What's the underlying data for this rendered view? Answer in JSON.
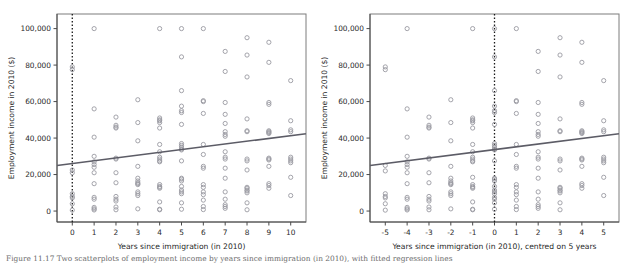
{
  "figure": {
    "caption": "Figure 11.17   Two scatterplots of employment income by years since immigration (in 2010), with fitted regression lines"
  },
  "chart_data": [
    {
      "id": "left",
      "type": "scatter",
      "title": "",
      "xlabel": "Years since immigration (in 2010)",
      "ylabel": "Employment income in 2010 ($)",
      "xlim": [
        -0.7,
        10.7
      ],
      "ylim": [
        -6000,
        108000
      ],
      "xticks": [
        0,
        1,
        2,
        3,
        4,
        5,
        6,
        7,
        8,
        9,
        10
      ],
      "xticklabels": [
        "0",
        "1",
        "2",
        "3",
        "4",
        "5",
        "6",
        "7",
        "8",
        "9",
        "10"
      ],
      "yticks": [
        0,
        20000,
        40000,
        60000,
        80000,
        100000
      ],
      "yticklabels": [
        "0",
        "20,000",
        "40,000",
        "60,000",
        "80,000",
        "100,000"
      ],
      "grid": false,
      "legend": null,
      "marker": "open-circle",
      "marker_color": "#9a9aa2",
      "fit_line": {
        "color": "#5c5c66",
        "x0": -0.7,
        "y0": 25000,
        "x1": 10.7,
        "y1": 42400,
        "intercept": 26100,
        "slope": 1530
      },
      "reference_line": {
        "type": "vertical-dashed",
        "x": 0,
        "color": "#1a1a1a"
      },
      "points": [
        [
          0,
          79000
        ],
        [
          0,
          77500
        ],
        [
          0,
          22500
        ],
        [
          0,
          21000
        ],
        [
          0,
          9500
        ],
        [
          0,
          8000
        ],
        [
          0,
          7200
        ],
        [
          0,
          4000
        ],
        [
          0,
          500
        ],
        [
          1,
          100000
        ],
        [
          1,
          56000
        ],
        [
          1,
          40500
        ],
        [
          1,
          30000
        ],
        [
          1,
          27000
        ],
        [
          1,
          25500
        ],
        [
          1,
          24000
        ],
        [
          1,
          21000
        ],
        [
          1,
          15000
        ],
        [
          1,
          7500
        ],
        [
          1,
          6500
        ],
        [
          1,
          2000
        ],
        [
          1,
          1200
        ],
        [
          1,
          600
        ],
        [
          2,
          51500
        ],
        [
          2,
          47000
        ],
        [
          2,
          46000
        ],
        [
          2,
          45500
        ],
        [
          2,
          29000
        ],
        [
          2,
          28500
        ],
        [
          2,
          21000
        ],
        [
          2,
          15500
        ],
        [
          2,
          8000
        ],
        [
          2,
          6500
        ],
        [
          2,
          5500
        ],
        [
          2,
          2200
        ],
        [
          2,
          700
        ],
        [
          3,
          61000
        ],
        [
          3,
          48500
        ],
        [
          3,
          38500
        ],
        [
          3,
          24500
        ],
        [
          3,
          18000
        ],
        [
          3,
          16500
        ],
        [
          3,
          15500
        ],
        [
          3,
          15000
        ],
        [
          3,
          14500
        ],
        [
          3,
          10500
        ],
        [
          3,
          9500
        ],
        [
          3,
          8500
        ],
        [
          3,
          1200
        ],
        [
          4,
          100000
        ],
        [
          4,
          51000
        ],
        [
          4,
          50000
        ],
        [
          4,
          49500
        ],
        [
          4,
          48500
        ],
        [
          4,
          45500
        ],
        [
          4,
          36500
        ],
        [
          4,
          32500
        ],
        [
          4,
          29500
        ],
        [
          4,
          28500
        ],
        [
          4,
          27500
        ],
        [
          4,
          27000
        ],
        [
          4,
          14500
        ],
        [
          4,
          13500
        ],
        [
          4,
          13000
        ],
        [
          4,
          12500
        ],
        [
          4,
          5000
        ],
        [
          4,
          1000
        ],
        [
          4,
          700
        ],
        [
          5,
          100000
        ],
        [
          5,
          84500
        ],
        [
          5,
          66000
        ],
        [
          5,
          57500
        ],
        [
          5,
          55000
        ],
        [
          5,
          54000
        ],
        [
          5,
          47500
        ],
        [
          5,
          37000
        ],
        [
          5,
          36000
        ],
        [
          5,
          35000
        ],
        [
          5,
          34000
        ],
        [
          5,
          33500
        ],
        [
          5,
          27500
        ],
        [
          5,
          18000
        ],
        [
          5,
          17500
        ],
        [
          5,
          16500
        ],
        [
          5,
          13500
        ],
        [
          5,
          11500
        ],
        [
          5,
          10500
        ],
        [
          5,
          9500
        ],
        [
          5,
          4500
        ],
        [
          5,
          1000
        ],
        [
          6,
          100000
        ],
        [
          6,
          60500
        ],
        [
          6,
          60000
        ],
        [
          6,
          53500
        ],
        [
          6,
          36500
        ],
        [
          6,
          31000
        ],
        [
          6,
          24500
        ],
        [
          6,
          23500
        ],
        [
          6,
          14500
        ],
        [
          6,
          13000
        ],
        [
          6,
          10500
        ],
        [
          6,
          9000
        ],
        [
          6,
          6000
        ],
        [
          6,
          2500
        ],
        [
          6,
          800
        ],
        [
          7,
          87500
        ],
        [
          7,
          76500
        ],
        [
          7,
          59500
        ],
        [
          7,
          53000
        ],
        [
          7,
          48000
        ],
        [
          7,
          43500
        ],
        [
          7,
          42000
        ],
        [
          7,
          41000
        ],
        [
          7,
          32500
        ],
        [
          7,
          29500
        ],
        [
          7,
          28500
        ],
        [
          7,
          23500
        ],
        [
          7,
          18000
        ],
        [
          7,
          10500
        ],
        [
          7,
          6500
        ],
        [
          7,
          3500
        ],
        [
          7,
          2500
        ],
        [
          7,
          1500
        ],
        [
          8,
          95000
        ],
        [
          8,
          85500
        ],
        [
          8,
          73500
        ],
        [
          8,
          50500
        ],
        [
          8,
          44000
        ],
        [
          8,
          43500
        ],
        [
          8,
          28500
        ],
        [
          8,
          27500
        ],
        [
          8,
          22500
        ],
        [
          8,
          13000
        ],
        [
          8,
          12500
        ],
        [
          8,
          11500
        ],
        [
          8,
          11000
        ],
        [
          8,
          10000
        ],
        [
          8,
          4500
        ],
        [
          8,
          700
        ],
        [
          9,
          92500
        ],
        [
          9,
          81500
        ],
        [
          9,
          59500
        ],
        [
          9,
          58500
        ],
        [
          9,
          44000
        ],
        [
          9,
          43500
        ],
        [
          9,
          43000
        ],
        [
          9,
          42500
        ],
        [
          9,
          29000
        ],
        [
          9,
          28500
        ],
        [
          9,
          28000
        ],
        [
          9,
          24500
        ],
        [
          9,
          15000
        ],
        [
          9,
          14000
        ],
        [
          9,
          12500
        ],
        [
          10,
          71500
        ],
        [
          10,
          49500
        ],
        [
          10,
          44500
        ],
        [
          10,
          43500
        ],
        [
          10,
          29500
        ],
        [
          10,
          28500
        ],
        [
          10,
          27500
        ],
        [
          10,
          26500
        ],
        [
          10,
          18500
        ],
        [
          10,
          8500
        ]
      ]
    },
    {
      "id": "right",
      "type": "scatter",
      "title": "",
      "xlabel": "Years since immigration (in 2010), centred on 5 years",
      "ylabel": "Employment income in 2010 ($)",
      "xlim": [
        -5.7,
        5.7
      ],
      "ylim": [
        -6000,
        108000
      ],
      "xticks": [
        -5,
        -4,
        -3,
        -2,
        -1,
        0,
        1,
        2,
        3,
        4,
        5
      ],
      "xticklabels": [
        "-5",
        "-4",
        "-3",
        "-2",
        "-1",
        "0",
        "1",
        "2",
        "3",
        "4",
        "5"
      ],
      "yticks": [
        0,
        20000,
        40000,
        60000,
        80000,
        100000
      ],
      "yticklabels": [
        "0",
        "20,000",
        "40,000",
        "60,000",
        "80,000",
        "100,000"
      ],
      "grid": false,
      "legend": null,
      "marker": "open-circle",
      "marker_color": "#9a9aa2",
      "fit_line": {
        "color": "#5c5c66",
        "x0": -5.7,
        "y0": 25000,
        "x1": 5.7,
        "y1": 42400,
        "intercept": 33700,
        "slope": 1530
      },
      "reference_line": {
        "type": "vertical-dashed",
        "x": 0,
        "color": "#1a1a1a"
      },
      "points": [
        [
          -5,
          79000
        ],
        [
          -5,
          77500
        ],
        [
          -5,
          25000
        ],
        [
          -5,
          22000
        ],
        [
          -5,
          9500
        ],
        [
          -5,
          8000
        ],
        [
          -5,
          7200
        ],
        [
          -5,
          4000
        ],
        [
          -5,
          500
        ],
        [
          -4,
          100000
        ],
        [
          -4,
          56000
        ],
        [
          -4,
          40500
        ],
        [
          -4,
          30000
        ],
        [
          -4,
          27000
        ],
        [
          -4,
          25500
        ],
        [
          -4,
          24000
        ],
        [
          -4,
          21000
        ],
        [
          -4,
          15000
        ],
        [
          -4,
          7500
        ],
        [
          -4,
          6500
        ],
        [
          -4,
          2000
        ],
        [
          -4,
          1200
        ],
        [
          -4,
          600
        ],
        [
          -3,
          51500
        ],
        [
          -3,
          47000
        ],
        [
          -3,
          46000
        ],
        [
          -3,
          45500
        ],
        [
          -3,
          29000
        ],
        [
          -3,
          28500
        ],
        [
          -3,
          21000
        ],
        [
          -3,
          15500
        ],
        [
          -3,
          8000
        ],
        [
          -3,
          6500
        ],
        [
          -3,
          5500
        ],
        [
          -3,
          2200
        ],
        [
          -3,
          700
        ],
        [
          -2,
          61000
        ],
        [
          -2,
          48500
        ],
        [
          -2,
          38500
        ],
        [
          -2,
          24500
        ],
        [
          -2,
          18000
        ],
        [
          -2,
          16500
        ],
        [
          -2,
          15500
        ],
        [
          -2,
          15000
        ],
        [
          -2,
          14500
        ],
        [
          -2,
          10500
        ],
        [
          -2,
          9500
        ],
        [
          -2,
          8500
        ],
        [
          -2,
          1200
        ],
        [
          -1,
          100000
        ],
        [
          -1,
          51000
        ],
        [
          -1,
          50000
        ],
        [
          -1,
          49500
        ],
        [
          -1,
          48500
        ],
        [
          -1,
          45500
        ],
        [
          -1,
          36500
        ],
        [
          -1,
          32500
        ],
        [
          -1,
          29500
        ],
        [
          -1,
          28500
        ],
        [
          -1,
          27500
        ],
        [
          -1,
          27000
        ],
        [
          -1,
          18500
        ],
        [
          -1,
          14500
        ],
        [
          -1,
          13500
        ],
        [
          -1,
          13000
        ],
        [
          -1,
          12500
        ],
        [
          -1,
          5000
        ],
        [
          -1,
          1000
        ],
        [
          -1,
          700
        ],
        [
          0,
          100000
        ],
        [
          0,
          84500
        ],
        [
          0,
          66000
        ],
        [
          0,
          57500
        ],
        [
          0,
          55000
        ],
        [
          0,
          54000
        ],
        [
          0,
          47500
        ],
        [
          0,
          37000
        ],
        [
          0,
          36000
        ],
        [
          0,
          35000
        ],
        [
          0,
          34000
        ],
        [
          0,
          33500
        ],
        [
          0,
          27500
        ],
        [
          0,
          18000
        ],
        [
          0,
          17500
        ],
        [
          0,
          16500
        ],
        [
          0,
          13500
        ],
        [
          0,
          11500
        ],
        [
          0,
          10500
        ],
        [
          0,
          9500
        ],
        [
          0,
          7500
        ],
        [
          0,
          6500
        ],
        [
          0,
          4500
        ],
        [
          0,
          1000
        ],
        [
          1,
          100000
        ],
        [
          1,
          60500
        ],
        [
          1,
          60000
        ],
        [
          1,
          53500
        ],
        [
          1,
          36500
        ],
        [
          1,
          31000
        ],
        [
          1,
          24500
        ],
        [
          1,
          23500
        ],
        [
          1,
          14500
        ],
        [
          1,
          13000
        ],
        [
          1,
          10500
        ],
        [
          1,
          9000
        ],
        [
          1,
          6000
        ],
        [
          1,
          2500
        ],
        [
          1,
          800
        ],
        [
          2,
          87500
        ],
        [
          2,
          76500
        ],
        [
          2,
          59500
        ],
        [
          2,
          53000
        ],
        [
          2,
          48000
        ],
        [
          2,
          43500
        ],
        [
          2,
          42000
        ],
        [
          2,
          41000
        ],
        [
          2,
          32500
        ],
        [
          2,
          29500
        ],
        [
          2,
          28500
        ],
        [
          2,
          23500
        ],
        [
          2,
          18000
        ],
        [
          2,
          10500
        ],
        [
          2,
          6500
        ],
        [
          2,
          3500
        ],
        [
          2,
          2500
        ],
        [
          2,
          1500
        ],
        [
          3,
          95000
        ],
        [
          3,
          85500
        ],
        [
          3,
          73500
        ],
        [
          3,
          50500
        ],
        [
          3,
          44000
        ],
        [
          3,
          43500
        ],
        [
          3,
          28500
        ],
        [
          3,
          27500
        ],
        [
          3,
          22500
        ],
        [
          3,
          13000
        ],
        [
          3,
          12500
        ],
        [
          3,
          11500
        ],
        [
          3,
          11000
        ],
        [
          3,
          10000
        ],
        [
          3,
          4500
        ],
        [
          3,
          700
        ],
        [
          4,
          92500
        ],
        [
          4,
          81500
        ],
        [
          4,
          59500
        ],
        [
          4,
          58500
        ],
        [
          4,
          44000
        ],
        [
          4,
          43500
        ],
        [
          4,
          43000
        ],
        [
          4,
          42500
        ],
        [
          4,
          29000
        ],
        [
          4,
          28500
        ],
        [
          4,
          28000
        ],
        [
          4,
          24500
        ],
        [
          4,
          15000
        ],
        [
          4,
          14000
        ],
        [
          4,
          12500
        ],
        [
          5,
          71500
        ],
        [
          5,
          49500
        ],
        [
          5,
          44500
        ],
        [
          5,
          43500
        ],
        [
          5,
          29500
        ],
        [
          5,
          28500
        ],
        [
          5,
          27500
        ],
        [
          5,
          26500
        ],
        [
          5,
          18500
        ],
        [
          5,
          8500
        ]
      ]
    }
  ]
}
